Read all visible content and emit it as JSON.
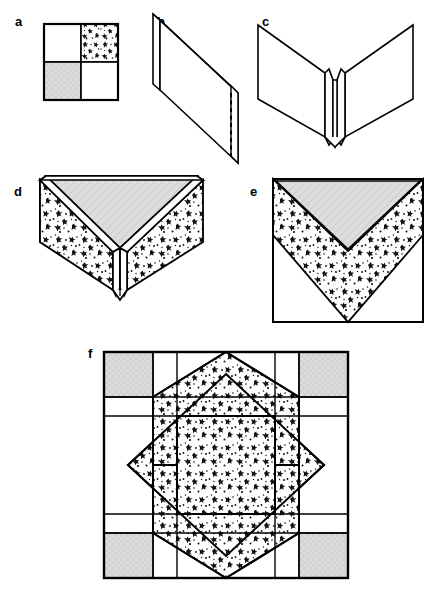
{
  "figure": {
    "panels": [
      {
        "id": "a",
        "label": "a",
        "caption": "Four-patch unit: plain, print, shaded, plain",
        "cells": [
          {
            "position": "top-left",
            "fill": "plain"
          },
          {
            "position": "top-right",
            "fill": "print"
          },
          {
            "position": "bottom-left",
            "fill": "shaded"
          },
          {
            "position": "bottom-right",
            "fill": "plain"
          }
        ]
      },
      {
        "id": "b",
        "label": "b",
        "caption": "Unit folded in half, fold line shown dashed",
        "fold_line_style": "dashed"
      },
      {
        "id": "c",
        "label": "c",
        "caption": "Folded unit opened into a V with centre pleat"
      },
      {
        "id": "d",
        "label": "d",
        "caption": "Three-dimensional view of folded prairie-point unit"
      },
      {
        "id": "e",
        "label": "e",
        "caption": "Flattened unit squared up: shaded triangle above, print V below"
      },
      {
        "id": "f",
        "label": "f",
        "caption": "Completed block: eight-pointed star on a five by five grid",
        "grid_rows": 5,
        "grid_cols": 5
      }
    ],
    "fills": {
      "plain": "#ffffff",
      "shaded": "#d9d9d9",
      "print_background": "#ffffff",
      "print_motif": "#111111",
      "outline": "#000000"
    }
  }
}
